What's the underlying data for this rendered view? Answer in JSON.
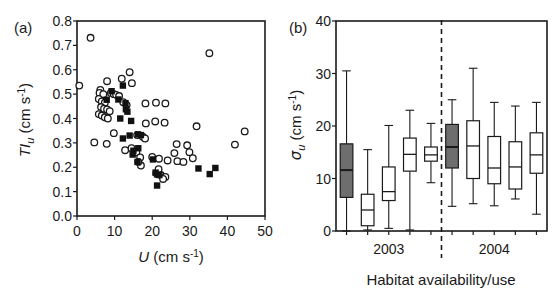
{
  "figure": {
    "panels": [
      {
        "tag": "(a)",
        "type": "scatter",
        "axis": {
          "x": {
            "label_main": "U",
            "label_unit": "(cm s",
            "label_exp": "-1",
            "label_close": ")",
            "min": 0,
            "max": 50,
            "ticks": [
              0,
              10,
              20,
              30,
              40,
              50
            ],
            "ticklabels": [
              "0",
              "10",
              "20",
              "30",
              "40",
              "50"
            ]
          },
          "y": {
            "label_main": "TI",
            "label_sub": "u",
            "label_unit": "(cm s",
            "label_exp": "-1",
            "label_close": ")",
            "min": 0.0,
            "max": 0.8,
            "ticks": [
              0.0,
              0.1,
              0.2,
              0.3,
              0.4,
              0.5,
              0.6,
              0.7,
              0.8
            ],
            "ticklabels": [
              "0.0",
              "0.1",
              "0.2",
              "0.3",
              "0.4",
              "0.5",
              "0.6",
              "0.7",
              "0.8"
            ]
          }
        }
      },
      {
        "tag": "(b)",
        "type": "boxplot",
        "axis": {
          "x": {
            "label": "Habitat availability/use",
            "group_labels": [
              "2003",
              "2004"
            ],
            "n_boxes": 10,
            "divider_after_box": 5
          },
          "y": {
            "label_main": "s",
            "label_sub": "u",
            "label_unit": "(cm s",
            "label_exp": "-1",
            "label_close": ")",
            "min": 0,
            "max": 40,
            "ticks": [
              0,
              10,
              20,
              30,
              40
            ],
            "ticklabels": [
              "0",
              "10",
              "20",
              "30",
              "40"
            ]
          }
        }
      }
    ]
  },
  "chart_data": [
    {
      "type": "scatter",
      "title": "(a)",
      "xlabel": "U (cm s-1)",
      "ylabel": "TIu (cm s-1)",
      "xlim": [
        0,
        50
      ],
      "ylim": [
        0.0,
        0.8
      ],
      "grid": false,
      "legend": null,
      "series": [
        {
          "name": "open-circles",
          "marker": "open-circle",
          "color": "#ffffff",
          "edge_color": "#1a1a1a",
          "points": [
            [
              3.6,
              0.731
            ],
            [
              0.6,
              0.535
            ],
            [
              35.2,
              0.668
            ],
            [
              14.0,
              0.59
            ],
            [
              11.9,
              0.563
            ],
            [
              14.6,
              0.545
            ],
            [
              8.0,
              0.553
            ],
            [
              6.2,
              0.517
            ],
            [
              6.0,
              0.505
            ],
            [
              7.0,
              0.5
            ],
            [
              9.0,
              0.505
            ],
            [
              9.8,
              0.5
            ],
            [
              10.4,
              0.497
            ],
            [
              11.2,
              0.492
            ],
            [
              5.8,
              0.48
            ],
            [
              6.6,
              0.47
            ],
            [
              7.4,
              0.465
            ],
            [
              12.3,
              0.467
            ],
            [
              13.2,
              0.455
            ],
            [
              6.4,
              0.447
            ],
            [
              7.2,
              0.44
            ],
            [
              8.0,
              0.437
            ],
            [
              8.7,
              0.43
            ],
            [
              18.2,
              0.462
            ],
            [
              21.0,
              0.465
            ],
            [
              23.5,
              0.462
            ],
            [
              5.8,
              0.418
            ],
            [
              6.6,
              0.412
            ],
            [
              7.4,
              0.405
            ],
            [
              8.2,
              0.4
            ],
            [
              20.8,
              0.388
            ],
            [
              23.3,
              0.383
            ],
            [
              9.8,
              0.34
            ],
            [
              18.3,
              0.38
            ],
            [
              31.8,
              0.368
            ],
            [
              4.6,
              0.302
            ],
            [
              7.9,
              0.296
            ],
            [
              16.0,
              0.332
            ],
            [
              17.5,
              0.325
            ],
            [
              18.1,
              0.318
            ],
            [
              26.5,
              0.295
            ],
            [
              29.3,
              0.29
            ],
            [
              42.0,
              0.293
            ],
            [
              44.6,
              0.347
            ],
            [
              14.5,
              0.278
            ],
            [
              12.8,
              0.27
            ],
            [
              15.8,
              0.262
            ],
            [
              25.9,
              0.258
            ],
            [
              29.9,
              0.262
            ],
            [
              30.8,
              0.237
            ],
            [
              16.8,
              0.24
            ],
            [
              20.0,
              0.242
            ],
            [
              21.8,
              0.235
            ],
            [
              24.1,
              0.228
            ],
            [
              26.7,
              0.225
            ],
            [
              28.3,
              0.222
            ],
            [
              17.0,
              0.207
            ],
            [
              21.1,
              0.175
            ],
            [
              22.3,
              0.168
            ],
            [
              23.5,
              0.16
            ],
            [
              22.9,
              0.152
            ],
            [
              21.7,
              0.192
            ],
            [
              16.3,
              0.222
            ]
          ]
        },
        {
          "name": "filled-squares",
          "marker": "filled-square",
          "color": "#111111",
          "edge_color": "#111111",
          "points": [
            [
              12.2,
              0.535
            ],
            [
              12.9,
              0.463
            ],
            [
              9.2,
              0.512
            ],
            [
              7.9,
              0.477
            ],
            [
              11.0,
              0.478
            ],
            [
              13.0,
              0.438
            ],
            [
              13.4,
              0.428
            ],
            [
              11.5,
              0.4
            ],
            [
              14.4,
              0.39
            ],
            [
              14.0,
              0.33
            ],
            [
              12.2,
              0.318
            ],
            [
              16.2,
              0.335
            ],
            [
              17.0,
              0.332
            ],
            [
              16.3,
              0.278
            ],
            [
              15.0,
              0.268
            ],
            [
              16.1,
              0.222
            ],
            [
              20.2,
              0.232
            ],
            [
              20.9,
              0.178
            ],
            [
              21.4,
              0.17
            ],
            [
              21.9,
              0.168
            ],
            [
              21.3,
              0.125
            ],
            [
              32.3,
              0.195
            ],
            [
              36.8,
              0.197
            ],
            [
              35.3,
              0.172
            ],
            [
              14.8,
              0.252
            ]
          ]
        }
      ]
    },
    {
      "type": "boxplot",
      "title": "(b)",
      "xlabel": "Habitat availability/use",
      "ylabel": "sigma_u (cm s-1)",
      "ylim": [
        0,
        40
      ],
      "grid": false,
      "group_labels": [
        "2003",
        "2004"
      ],
      "divider": {
        "after_box": 5,
        "style": "dashed"
      },
      "boxes": [
        {
          "index": 1,
          "group": "2003",
          "fill": "shaded",
          "whisker_low": 0.0,
          "q1": 6.4,
          "median": 11.6,
          "q3": 16.6,
          "whisker_high": 30.5
        },
        {
          "index": 2,
          "group": "2003",
          "fill": "open",
          "whisker_low": 0.2,
          "q1": 1.0,
          "median": 4.0,
          "q3": 7.0,
          "whisker_high": 15.5
        },
        {
          "index": 3,
          "group": "2003",
          "fill": "open",
          "whisker_low": 0.5,
          "q1": 5.8,
          "median": 7.5,
          "q3": 12.2,
          "whisker_high": 20.1
        },
        {
          "index": 4,
          "group": "2003",
          "fill": "open",
          "whisker_low": 0.2,
          "q1": 11.4,
          "median": 14.6,
          "q3": 17.7,
          "whisker_high": 23.0
        },
        {
          "index": 5,
          "group": "2003",
          "fill": "open",
          "whisker_low": 9.2,
          "q1": 13.3,
          "median": 14.5,
          "q3": 16.0,
          "whisker_high": 20.5
        },
        {
          "index": 6,
          "group": "2004",
          "fill": "shaded",
          "whisker_low": 4.7,
          "q1": 12.0,
          "median": 16.0,
          "q3": 20.3,
          "whisker_high": 25.0
        },
        {
          "index": 7,
          "group": "2004",
          "fill": "open",
          "whisker_low": 5.2,
          "q1": 10.0,
          "median": 16.2,
          "q3": 21.0,
          "whisker_high": 31.0
        },
        {
          "index": 8,
          "group": "2004",
          "fill": "open",
          "whisker_low": 4.8,
          "q1": 9.0,
          "median": 12.0,
          "q3": 18.0,
          "whisker_high": 24.5
        },
        {
          "index": 9,
          "group": "2004",
          "fill": "open",
          "whisker_low": 6.1,
          "q1": 8.0,
          "median": 12.2,
          "q3": 17.0,
          "whisker_high": 23.8
        },
        {
          "index": 10,
          "group": "2004",
          "fill": "open",
          "whisker_low": 3.2,
          "q1": 11.0,
          "median": 14.5,
          "q3": 18.7,
          "whisker_high": 24.5
        }
      ]
    }
  ]
}
